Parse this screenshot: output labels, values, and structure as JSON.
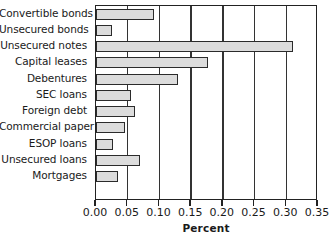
{
  "chart_data": {
    "type": "bar",
    "orientation": "horizontal",
    "title": "",
    "xlabel": "Percent",
    "ylabel": "",
    "xlim": [
      0.0,
      0.35
    ],
    "xticks": [
      "0.00",
      "0.05",
      "0.10",
      "0.15",
      "0.20",
      "0.25",
      "0.30",
      "0.35"
    ],
    "xtick_values": [
      0.0,
      0.05,
      0.1,
      0.15,
      0.2,
      0.25,
      0.3,
      0.35
    ],
    "grid": "vertical",
    "legend": "none",
    "bar_fill_color": "#dcdcdc",
    "bar_edge_color": "#2b2b2b",
    "categories": [
      "Convertible bonds",
      "Unsecured bonds",
      "Unsecured notes",
      "Capital leases",
      "Debentures",
      "SEC loans",
      "Foreign debt",
      "Commercial paper",
      "ESOP loans",
      "Unsecured loans",
      "Mortgages"
    ],
    "values": [
      0.092,
      0.025,
      0.311,
      0.177,
      0.13,
      0.055,
      0.061,
      0.046,
      0.027,
      0.069,
      0.035
    ]
  }
}
